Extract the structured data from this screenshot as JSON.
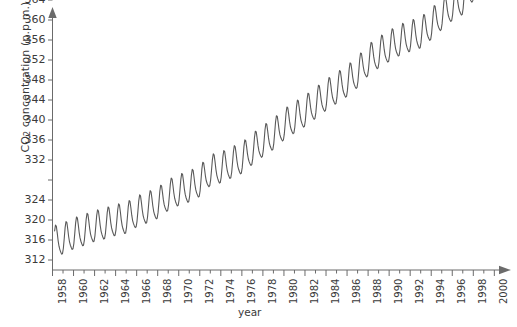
{
  "chart_data": {
    "type": "line",
    "title": "",
    "subtitle": "",
    "xlabel": "year",
    "ylabel": "CO2 concentration (p.p.m.)",
    "ylabel_parts": {
      "prefix": "CO",
      "subscript": "2",
      "suffix": " concentration (p.p.m.)"
    },
    "xlim": [
      1958,
      2000
    ],
    "ylim": [
      310,
      373
    ],
    "grid": false,
    "legend": false,
    "legend_position": "none",
    "line_color": "#595959",
    "axis_color": "#6b6b6b",
    "background_color": "#ffffff",
    "x_tick_labels": [
      "1958",
      "1960",
      "1962",
      "1964",
      "1966",
      "1968",
      "1970",
      "1972",
      "1974",
      "1976",
      "1978",
      "1980",
      "1982",
      "1984",
      "1986",
      "1988",
      "1990",
      "1992",
      "1994",
      "1996",
      "1998",
      "2000"
    ],
    "x_tick_values": [
      1958,
      1960,
      1962,
      1964,
      1966,
      1968,
      1970,
      1972,
      1974,
      1976,
      1978,
      1980,
      1982,
      1984,
      1986,
      1988,
      1990,
      1992,
      1994,
      1996,
      1998,
      2000
    ],
    "x_minor_tick_interval": 1,
    "y_tick_labels": [
      "312",
      "316",
      "320",
      "324",
      "332",
      "336",
      "340",
      "344",
      "348",
      "352",
      "356",
      "360",
      "364",
      "368",
      "372"
    ],
    "y_tick_values": [
      312,
      316,
      320,
      324,
      332,
      336,
      340,
      344,
      348,
      352,
      356,
      360,
      364,
      368,
      372
    ],
    "y_tick_note": "label for 328 is absent in the source image; tick positions remain evenly spaced every 4 ppm",
    "series": [
      {
        "name": "Mauna Loa monthly mean CO2",
        "x_start": 1958.2,
        "x_end": 1998.5,
        "annual_mean": [
          {
            "year": 1958,
            "value": 315.3
          },
          {
            "year": 1959,
            "value": 315.9
          },
          {
            "year": 1960,
            "value": 316.9
          },
          {
            "year": 1961,
            "value": 317.6
          },
          {
            "year": 1962,
            "value": 318.4
          },
          {
            "year": 1963,
            "value": 318.9
          },
          {
            "year": 1964,
            "value": 319.6
          },
          {
            "year": 1965,
            "value": 320.0
          },
          {
            "year": 1966,
            "value": 321.3
          },
          {
            "year": 1967,
            "value": 322.1
          },
          {
            "year": 1968,
            "value": 323.0
          },
          {
            "year": 1969,
            "value": 324.6
          },
          {
            "year": 1970,
            "value": 325.6
          },
          {
            "year": 1971,
            "value": 326.3
          },
          {
            "year": 1972,
            "value": 327.4
          },
          {
            "year": 1973,
            "value": 329.6
          },
          {
            "year": 1974,
            "value": 330.1
          },
          {
            "year": 1975,
            "value": 331.1
          },
          {
            "year": 1976,
            "value": 332.0
          },
          {
            "year": 1977,
            "value": 333.8
          },
          {
            "year": 1978,
            "value": 335.4
          },
          {
            "year": 1979,
            "value": 336.8
          },
          {
            "year": 1980,
            "value": 338.7
          },
          {
            "year": 1981,
            "value": 340.1
          },
          {
            "year": 1982,
            "value": 341.4
          },
          {
            "year": 1983,
            "value": 343.0
          },
          {
            "year": 1984,
            "value": 344.6
          },
          {
            "year": 1985,
            "value": 346.0
          },
          {
            "year": 1986,
            "value": 347.4
          },
          {
            "year": 1987,
            "value": 349.2
          },
          {
            "year": 1988,
            "value": 351.6
          },
          {
            "year": 1989,
            "value": 353.1
          },
          {
            "year": 1990,
            "value": 354.4
          },
          {
            "year": 1991,
            "value": 355.6
          },
          {
            "year": 1992,
            "value": 356.4
          },
          {
            "year": 1993,
            "value": 357.1
          },
          {
            "year": 1994,
            "value": 358.8
          },
          {
            "year": 1995,
            "value": 360.8
          },
          {
            "year": 1996,
            "value": 362.6
          },
          {
            "year": 1997,
            "value": 363.8
          },
          {
            "year": 1998,
            "value": 366.6
          }
        ],
        "seasonal_amplitude": 6.0,
        "seasonal_peak_month": 5,
        "description": "Rising trend with annual sawtooth oscillation (Keeling Curve)"
      }
    ],
    "annotations": []
  },
  "axes": {
    "y_arrow": true,
    "x_arrow": true
  }
}
